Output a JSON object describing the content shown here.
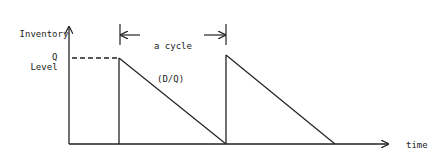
{
  "diagram": {
    "y_axis_label_line1": "Inventory",
    "y_axis_label_line2": "Level",
    "q_label": "Q",
    "cycle_label_line1": "a cycle",
    "cycle_label_line2": "(D/Q)",
    "x_axis_label": "time",
    "line_color": "#222222"
  }
}
